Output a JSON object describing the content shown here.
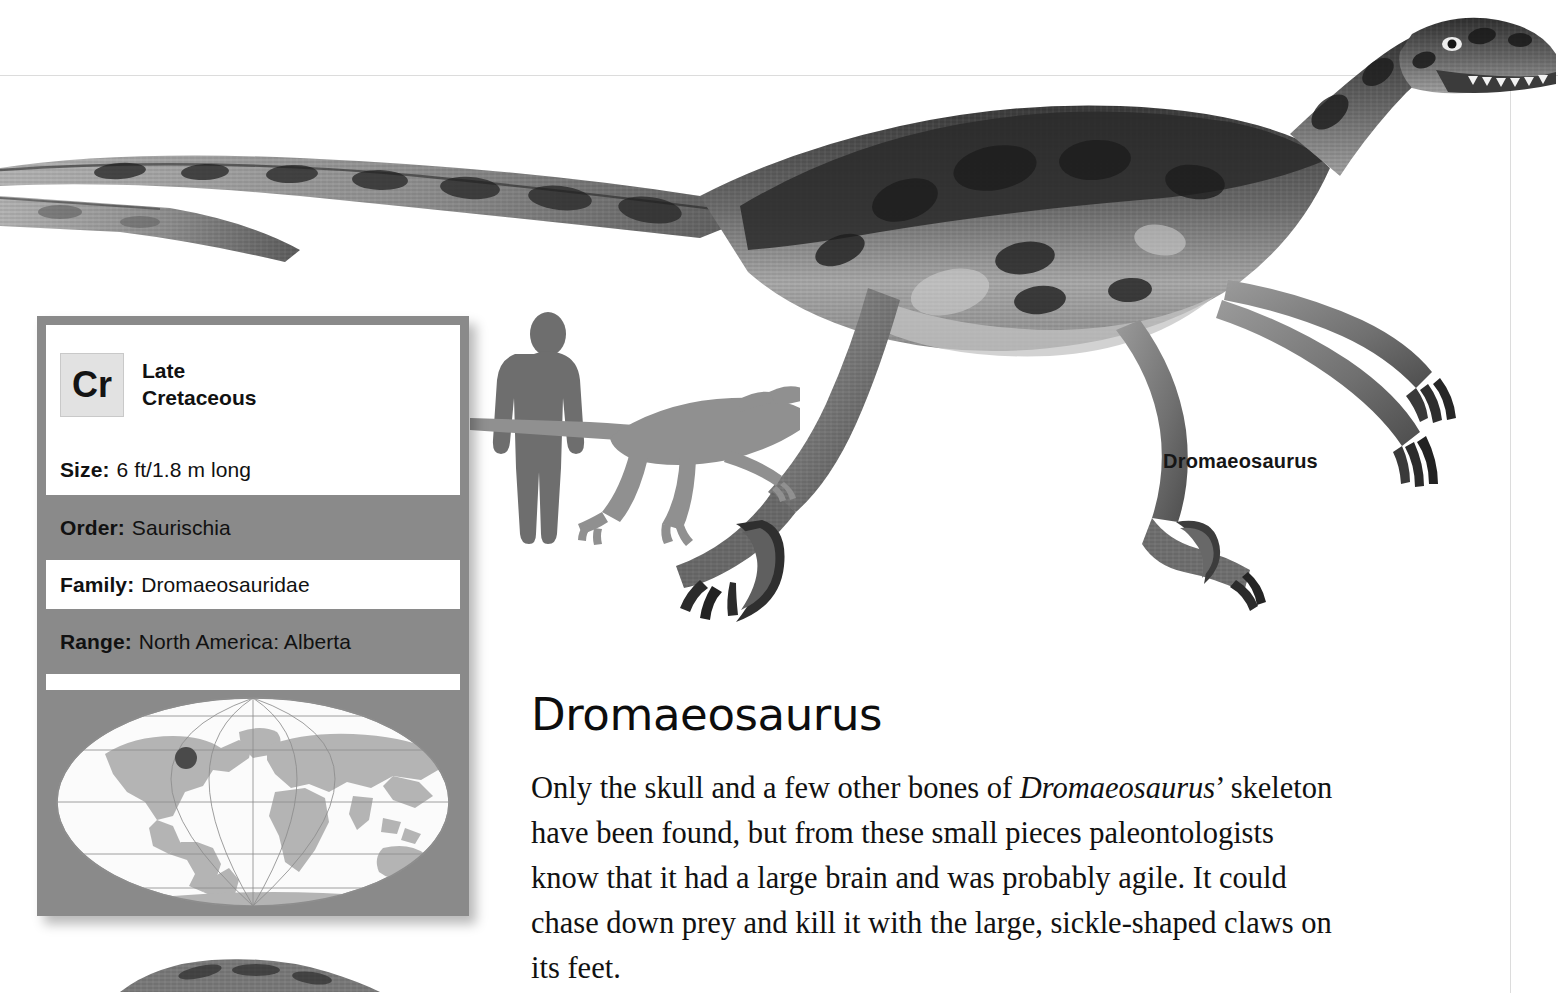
{
  "page": {
    "background": "#ffffff",
    "rule_color": "#dcdcdc"
  },
  "infobox": {
    "panel_color": "#8a8a8a",
    "row_white": "#ffffff",
    "period": {
      "badge_label": "Cr",
      "badge_icon": "period-badge-icon",
      "epoch_line1": "Late",
      "epoch_line2": "Cretaceous"
    },
    "rows": [
      {
        "label": "Size:",
        "value": "6 ft/1.8 m long",
        "shade": "white"
      },
      {
        "label": "Order:",
        "value": "Saurischia",
        "shade": "gray"
      },
      {
        "label": "Family:",
        "value": "Dromaeosauridae",
        "shade": "white"
      },
      {
        "label": "Range:",
        "value": "North America: Alberta",
        "shade": "gray"
      },
      {
        "label": "Pronun:",
        "value": "DROM-mee-oh-SAW-rus",
        "shade": "white"
      }
    ],
    "map": {
      "icon": "world-map-icon",
      "ocean_color": "#fbfbfb",
      "land_color": "#b4b4b4",
      "graticule_color": "#8d8d8d",
      "marker_color": "#4a4a4a",
      "marker_label": "Alberta locality marker"
    }
  },
  "scale_diagram": {
    "icon": "scale-comparison-icon",
    "human_color": "#6e6e6e",
    "dino_color": "#909090"
  },
  "illustration": {
    "icon": "dromaeosaurus-illustration-icon",
    "caption": "Dromaeosaurus"
  },
  "article": {
    "title": "Dromaeosaurus",
    "paragraph_part1": "Only the skull and a few other bones of ",
    "paragraph_italic": "Dromaeosaurus",
    "paragraph_part2": "’ skeleton have been found, but from these small pieces paleontologists know that it had a large brain and was probably agile. It could chase down prey and kill it with the large, sickle-shaped claws on its feet."
  }
}
